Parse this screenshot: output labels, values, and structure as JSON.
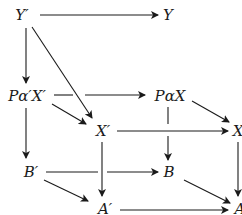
{
  "diagram": {
    "type": "commutative-cube",
    "nodes": {
      "Yp": {
        "label": "Y′",
        "x": 22,
        "y": 15
      },
      "Y": {
        "label": "Y",
        "x": 168,
        "y": 15
      },
      "PaXp": {
        "label": "Pα′X′",
        "x": 26,
        "y": 96
      },
      "PaX": {
        "label": "PαX",
        "x": 170,
        "y": 96
      },
      "Xp": {
        "label": "X′",
        "x": 102,
        "y": 130
      },
      "X": {
        "label": "X",
        "x": 238,
        "y": 130
      },
      "Bp": {
        "label": "B′",
        "x": 30,
        "y": 171
      },
      "B": {
        "label": "B",
        "x": 169,
        "y": 171
      },
      "Ap": {
        "label": "A′",
        "x": 104,
        "y": 208
      },
      "A": {
        "label": "A",
        "x": 240,
        "y": 208
      }
    },
    "edges": [
      {
        "from": "Yp",
        "to": "Y"
      },
      {
        "from": "Yp",
        "to": "PaXp"
      },
      {
        "from": "Yp",
        "to": "Xp"
      },
      {
        "from": "PaXp",
        "to": "PaX"
      },
      {
        "from": "PaXp",
        "to": "Xp"
      },
      {
        "from": "PaXp",
        "to": "Bp"
      },
      {
        "from": "PaX",
        "to": "X"
      },
      {
        "from": "PaX",
        "to": "B"
      },
      {
        "from": "Xp",
        "to": "X"
      },
      {
        "from": "Xp",
        "to": "Ap"
      },
      {
        "from": "X",
        "to": "A"
      },
      {
        "from": "Bp",
        "to": "B"
      },
      {
        "from": "Bp",
        "to": "Ap"
      },
      {
        "from": "B",
        "to": "A"
      },
      {
        "from": "Ap",
        "to": "A"
      }
    ],
    "stroke_color": "#1a1a1a"
  }
}
